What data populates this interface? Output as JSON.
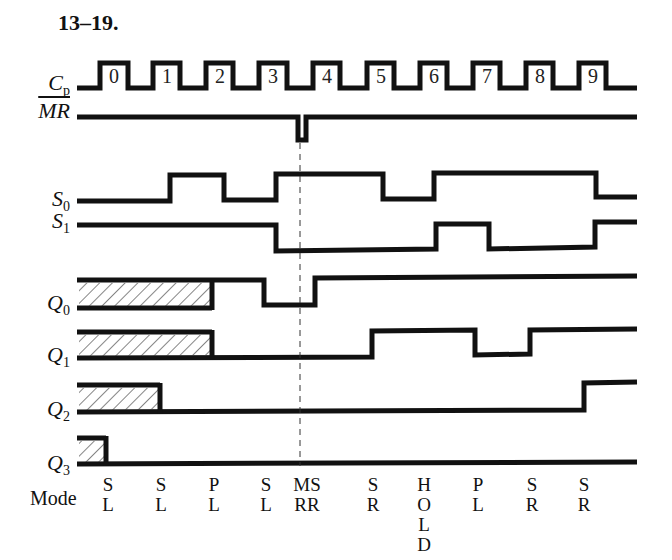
{
  "title": "13–19.",
  "signals": {
    "cp": {
      "name": "C",
      "sub": "p"
    },
    "mr": {
      "name": "MR"
    },
    "s0": {
      "name": "S",
      "sub": "0"
    },
    "s1": {
      "name": "S",
      "sub": "1"
    },
    "q0": {
      "name": "Q",
      "sub": "0"
    },
    "q1": {
      "name": "Q",
      "sub": "1"
    },
    "q2": {
      "name": "Q",
      "sub": "2"
    },
    "q3": {
      "name": "Q",
      "sub": "3"
    }
  },
  "clock_pulses": [
    "0",
    "1",
    "2",
    "3",
    "4",
    "5",
    "6",
    "7",
    "8",
    "9"
  ],
  "mode": {
    "label": "Mode",
    "columns": [
      {
        "x": 108,
        "lines": [
          "S",
          "L"
        ]
      },
      {
        "x": 161,
        "lines": [
          "S",
          "L"
        ]
      },
      {
        "x": 214,
        "lines": [
          "P",
          "L"
        ]
      },
      {
        "x": 266,
        "lines": [
          "S",
          "L"
        ]
      },
      {
        "x": 307,
        "lines": [
          "MS",
          "RR"
        ]
      },
      {
        "x": 373,
        "lines": [
          "S",
          "R"
        ]
      },
      {
        "x": 424,
        "lines": [
          "H",
          "O",
          "L",
          "D"
        ]
      },
      {
        "x": 478,
        "lines": [
          "P",
          "L"
        ]
      },
      {
        "x": 532,
        "lines": [
          "S",
          "R"
        ]
      },
      {
        "x": 584,
        "lines": [
          "S",
          "R"
        ]
      }
    ]
  },
  "chart_data": {
    "type": "timing",
    "title": "13–19.",
    "signals": [
      "Cp",
      "MR_bar",
      "S0",
      "S1",
      "Q0",
      "Q1",
      "Q2",
      "Q3"
    ],
    "clock_edges": [
      0,
      1,
      2,
      3,
      4,
      5,
      6,
      7,
      8,
      9
    ],
    "MR_bar": "high, brief low pulse between clock 3 and 4",
    "S0": [
      0,
      1,
      0,
      1,
      1,
      0,
      1,
      1,
      1,
      0
    ],
    "S1": [
      1,
      1,
      1,
      0,
      0,
      0,
      1,
      0,
      0,
      1
    ],
    "Q0": [
      "X",
      "X",
      "1",
      "0",
      "1",
      "1",
      "1",
      "1",
      "1",
      "1"
    ],
    "Q1": [
      "X",
      "X",
      "0",
      "0",
      "0",
      "1",
      "1",
      "0",
      "1",
      "1"
    ],
    "Q2": [
      "X",
      "0",
      "0",
      "0",
      "0",
      "0",
      "0",
      "0",
      "0",
      "1"
    ],
    "Q3": [
      "X",
      "0",
      "0",
      "0",
      "0",
      "0",
      "0",
      "0",
      "0",
      "0"
    ],
    "modes": [
      "SL",
      "SL",
      "PL",
      "SL",
      "MR",
      "SR",
      "HOLD",
      "PL",
      "SR",
      "SR"
    ]
  }
}
